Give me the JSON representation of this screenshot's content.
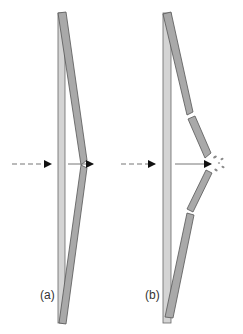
{
  "panels": [
    {
      "id": "a",
      "label": "(a)",
      "state": "intact"
    },
    {
      "id": "b",
      "label": "(b)",
      "state": "fractured"
    }
  ],
  "colors": {
    "background": "#ffffff",
    "vertical_bar_fill": "#d4d4d4",
    "angled_bar_fill": "#a9a9a9",
    "stroke": "#555555",
    "arrow": "#111111",
    "dashed_line": "#777777",
    "debris": "#8a8a8a"
  }
}
